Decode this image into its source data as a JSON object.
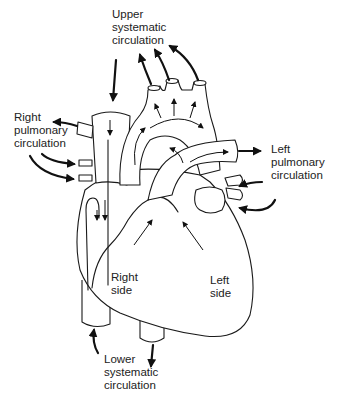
{
  "diagram": {
    "type": "heart-circulation-flow",
    "line_color": "#1a1a1a",
    "background": "#ffffff",
    "labels": {
      "upper_systematic": {
        "line1": "Upper",
        "line2": "systematic",
        "line3": "circulation"
      },
      "right_pulmonary": {
        "line1": "Right",
        "line2": "pulmonary",
        "line3": "circulation"
      },
      "left_pulmonary": {
        "line1": "Left",
        "line2": "pulmonary",
        "line3": "circulation"
      },
      "right_side": {
        "line1": "Right",
        "line2": "side"
      },
      "left_side": {
        "line1": "Left",
        "line2": "side"
      },
      "lower_systematic": {
        "line1": "Lower",
        "line2": "systematic",
        "line3": "circulation"
      }
    }
  }
}
